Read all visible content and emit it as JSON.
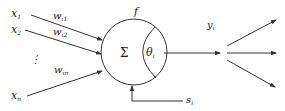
{
  "diagram": {
    "type": "neuron-model",
    "colors": {
      "line": "#333333",
      "text": "#222222",
      "background": "#ffffff"
    },
    "inputs": [
      {
        "label": "x",
        "sub": "1",
        "weight": "w",
        "weight_sub": "i1"
      },
      {
        "label": "x",
        "sub": "2",
        "weight": "w",
        "weight_sub": "i2"
      },
      {
        "label": "x",
        "sub": "n",
        "weight": "w",
        "weight_sub": "in"
      }
    ],
    "ellipsis": "⋮",
    "neuron": {
      "function_label": "f",
      "sum_symbol": "Σ",
      "threshold": "θ",
      "threshold_sub": "i"
    },
    "external_input": {
      "label": "s",
      "sub": "i"
    },
    "output": {
      "label": "y",
      "sub": "i",
      "branches": 3
    }
  }
}
